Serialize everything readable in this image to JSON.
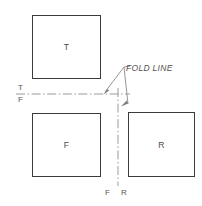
{
  "diagram": {
    "background_color": "#ffffff",
    "line_color": "#8a8a8a",
    "box_border_color": "#3b3b3b",
    "text_color": "#555555",
    "views": [
      {
        "key": "top",
        "label": "T",
        "name": "top-view",
        "x": 32,
        "y": 15,
        "w": 69,
        "h": 64
      },
      {
        "key": "front",
        "label": "F",
        "name": "front-view",
        "x": 32,
        "y": 113,
        "w": 69,
        "h": 64
      },
      {
        "key": "right",
        "label": "R",
        "name": "right-side-view",
        "x": 128,
        "y": 112,
        "w": 67,
        "h": 65
      }
    ],
    "annotations": {
      "fold_line_label": "FOLD LINE",
      "horizontal_reference_upper": "T",
      "horizontal_reference_lower": "F",
      "vertical_reference_left": "F",
      "vertical_reference_right": "R"
    },
    "reference_lines": {
      "horizontal": {
        "y": 94,
        "x_start": 16,
        "x_end": 130,
        "style": "dash-dot"
      },
      "vertical": {
        "x": 118,
        "y_start": 88,
        "y_end": 186,
        "style": "dash-dot"
      }
    },
    "leaders": {
      "apex": {
        "x": 124,
        "y": 67
      },
      "arrow_left_target": {
        "x": 104,
        "y": 93
      },
      "arrow_right_target": {
        "x": 127,
        "y": 106
      }
    }
  }
}
